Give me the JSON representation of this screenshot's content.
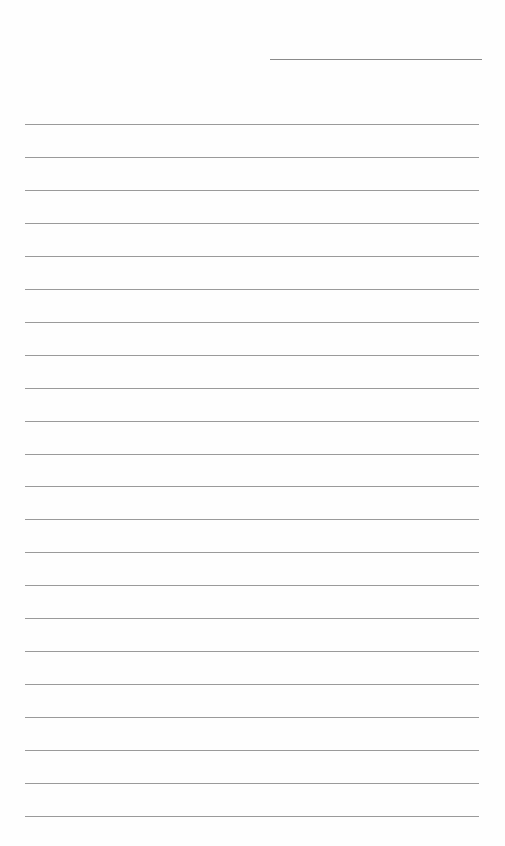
{
  "page": {
    "type": "blank lined writing page",
    "background_color": "#fefefe",
    "line_color": "#9a9a9a",
    "header_line": {
      "left": 270,
      "top": 59,
      "width": 212
    },
    "rules": {
      "count": 22,
      "left": 25,
      "width": 454,
      "first_top": 124,
      "spacing": 32.95
    }
  }
}
